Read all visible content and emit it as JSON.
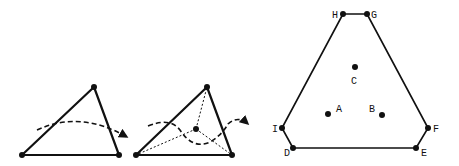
{
  "diagram": {
    "background": "#ffffff",
    "stroke_color": "#111111",
    "figures": [
      {
        "id": "single-triangle",
        "triangle": {
          "apex": [
            94,
            87
          ],
          "bottom_left": [
            22,
            155
          ],
          "bottom_right": [
            119,
            155
          ]
        },
        "dashed_arrow": {
          "path": "M 37 130 Q 75 113 127 137"
        }
      },
      {
        "id": "subdivided-triangle",
        "triangle": {
          "apex": [
            207,
            87
          ],
          "bottom_left": [
            136,
            155
          ],
          "bottom_right": [
            232,
            155
          ]
        },
        "center_point": [
          196,
          129
        ],
        "dashed_arrow": {
          "path": "M 148 128 Q 170 118 183 134 Q 196 152 213 138 Q 226 118 245 128"
        }
      },
      {
        "id": "hexagon-region",
        "vertices": [
          {
            "label": "H",
            "pos": [
              343,
              14
            ]
          },
          {
            "label": "G",
            "pos": [
              367,
              14
            ]
          },
          {
            "label": "F",
            "pos": [
              428,
              128
            ]
          },
          {
            "label": "E",
            "pos": [
              416,
              148
            ]
          },
          {
            "label": "D",
            "pos": [
              293,
              148
            ]
          },
          {
            "label": "I",
            "pos": [
              282,
              128
            ]
          }
        ],
        "interior_points": [
          {
            "label": "C",
            "pos": [
              355,
              67
            ]
          },
          {
            "label": "A",
            "pos": [
              328,
              114
            ]
          },
          {
            "label": "B",
            "pos": [
              382,
              115
            ]
          }
        ]
      }
    ]
  }
}
